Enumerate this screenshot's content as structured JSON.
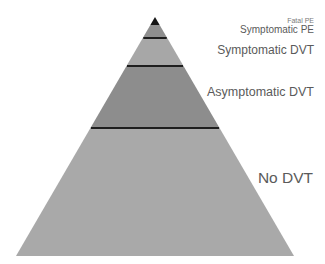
{
  "diagram": {
    "type": "pyramid",
    "apex": [
      155,
      17
    ],
    "base_left": [
      16,
      256
    ],
    "base_right": [
      294,
      256
    ],
    "tiers": [
      {
        "label": "Fatal PE",
        "top_y": 17,
        "bottom_y": 25,
        "color": "#141414"
      },
      {
        "label": "Symptomatic PE",
        "top_y": 25,
        "bottom_y": 38,
        "color": "#8e8e8e"
      },
      {
        "label": "Symptomatic DVT",
        "top_y": 38,
        "bottom_y": 66,
        "color": "#a7a7a7"
      },
      {
        "label": "Asymptomatic DVT",
        "top_y": 66,
        "bottom_y": 128,
        "color": "#8d8d8d"
      },
      {
        "label": "No DVT",
        "top_y": 128,
        "bottom_y": 256,
        "color": "#a9a9a9"
      }
    ],
    "divider_color": "#1e1e1e",
    "divider_ys": [
      38,
      66,
      128
    ]
  },
  "labels": {
    "fatal_pe": "Fatal PE",
    "symptomatic_pe": "Symptomatic PE",
    "symptomatic_dvt": "Symptomatic DVT",
    "asymptomatic_dvt": "Asymptomatic DVT",
    "no_dvt": "No DVT"
  }
}
